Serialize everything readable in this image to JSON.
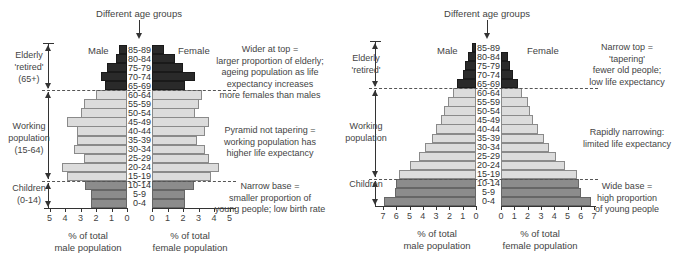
{
  "left_pyramid": {
    "top_label": "Different age groups",
    "male_label": "Male",
    "female_label": "Female",
    "side_labels": {
      "elderly": [
        "Elderly",
        "'retired'",
        "(65+)"
      ],
      "working": [
        "Working",
        "population",
        "(15-64)"
      ],
      "children": [
        "Children",
        "(0-14)"
      ]
    },
    "notes": {
      "top": [
        "Wider at top =",
        "larger proportion of elderly;",
        "ageing population as life",
        "expectancy increases",
        "more females than males"
      ],
      "middle": [
        "Pyramid not tapering =",
        "working population has",
        "higher life expectancy"
      ],
      "bottom": [
        "Narrow base =",
        "smaller proportion of",
        "young people; low birth rate"
      ]
    },
    "male_ticks": [
      "5",
      "4",
      "3",
      "2",
      "1",
      "0"
    ],
    "female_ticks": [
      "0",
      "1",
      "2",
      "3",
      "4",
      "5"
    ],
    "male_axis_label": [
      "% of total",
      "male population"
    ],
    "female_axis_label": [
      "% of total",
      "female population"
    ]
  },
  "right_pyramid": {
    "top_label": "Different age groups",
    "male_label": "Male",
    "female_label": "Female",
    "side_labels": {
      "elderly": [
        "Elderly",
        "'retired'"
      ],
      "working": [
        "Working",
        "population"
      ],
      "children": [
        "Children"
      ]
    },
    "notes": {
      "top": [
        "Narrow top =",
        "'tapering'",
        "fewer old people;",
        "low life expectancy"
      ],
      "middle": [
        "Rapidly narrowing:",
        "limited life expectancy"
      ],
      "bottom": [
        "Wide base =",
        "high proportion",
        "of young people"
      ]
    },
    "male_ticks": [
      "7",
      "6",
      "5",
      "4",
      "3",
      "2",
      "1",
      "0"
    ],
    "female_ticks": [
      "0",
      "1",
      "2",
      "3",
      "4",
      "5",
      "6",
      "7"
    ],
    "male_axis_label": [
      "% of total",
      "male population"
    ],
    "female_axis_label": [
      "% of total",
      "female population"
    ]
  },
  "chart_data": [
    {
      "type": "bar",
      "title": "Population pyramid – ageing population (wider at top)",
      "orientation": "horizontal-back-to-back",
      "categories": [
        "85-89",
        "80-84",
        "75-79",
        "70-74",
        "65-69",
        "60-64",
        "55-59",
        "50-54",
        "45-49",
        "40-44",
        "35-39",
        "30-34",
        "25-29",
        "20-24",
        "15-19",
        "10-14",
        "5-9",
        "0-4"
      ],
      "groups": {
        "elderly (65+)": [
          "85-89",
          "80-84",
          "75-79",
          "70-74",
          "65-69"
        ],
        "working (15-64)": [
          "60-64",
          "55-59",
          "50-54",
          "45-49",
          "40-44",
          "35-39",
          "30-34",
          "25-29",
          "20-24",
          "15-19"
        ],
        "children (0-14)": [
          "10-14",
          "5-9",
          "0-4"
        ]
      },
      "series": [
        {
          "name": "Male",
          "values": [
            0.5,
            0.7,
            1.3,
            1.7,
            1.4,
            2.0,
            2.8,
            3.0,
            3.9,
            3.2,
            3.2,
            3.4,
            2.8,
            4.2,
            3.9,
            2.7,
            2.3,
            2.3
          ]
        },
        {
          "name": "Female",
          "values": [
            0.8,
            1.5,
            2.0,
            2.8,
            2.1,
            3.2,
            3.0,
            2.8,
            3.7,
            3.4,
            2.9,
            3.4,
            3.7,
            4.3,
            3.8,
            2.7,
            2.1,
            2.1
          ]
        }
      ],
      "xlabel": "% of total male population / % of total female population",
      "ylabel": "Different age groups",
      "xlim": [
        0,
        5
      ],
      "grid": false
    },
    {
      "type": "bar",
      "title": "Population pyramid – young population (narrow top, wide base)",
      "orientation": "horizontal-back-to-back",
      "categories": [
        "85-89",
        "80-84",
        "75-79",
        "70-74",
        "65-69",
        "60-64",
        "55-59",
        "50-54",
        "45-49",
        "40-44",
        "35-39",
        "30-34",
        "25-29",
        "20-24",
        "15-19",
        "10-14",
        "5-9",
        "0-4"
      ],
      "groups": {
        "elderly": [
          "85-89",
          "80-84",
          "75-79",
          "70-74",
          "65-69"
        ],
        "working": [
          "60-64",
          "55-59",
          "50-54",
          "45-49",
          "40-44",
          "35-39",
          "30-34",
          "25-29",
          "20-24",
          "15-19"
        ],
        "children": [
          "10-14",
          "5-9",
          "0-4"
        ]
      },
      "series": [
        {
          "name": "Male",
          "values": [
            0.3,
            0.6,
            0.8,
            1.0,
            1.4,
            1.7,
            2.1,
            2.4,
            2.6,
            3.0,
            3.3,
            3.8,
            4.3,
            5.0,
            5.8,
            6.0,
            6.1,
            6.9
          ]
        },
        {
          "name": "Female",
          "values": [
            0.0,
            0.5,
            0.7,
            0.9,
            1.3,
            1.6,
            2.0,
            2.2,
            2.4,
            2.8,
            3.2,
            3.6,
            4.1,
            4.8,
            5.7,
            5.9,
            6.0,
            6.8
          ]
        }
      ],
      "xlabel": "% of total male population / % of total female population",
      "ylabel": "Different age groups",
      "xlim": [
        0,
        7
      ],
      "grid": false
    }
  ]
}
